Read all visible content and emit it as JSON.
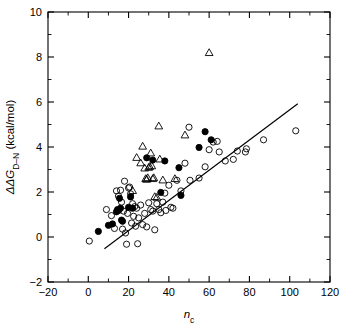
{
  "chart_data": {
    "type": "scatter",
    "title": "",
    "xlabel": "n_c",
    "xlabel_base": "n",
    "xlabel_sub": "c",
    "ylabel": "ΔΔG_D–N (kcal/mol)",
    "ylabel_base": "ΔΔG",
    "ylabel_sub": "D–N",
    "ylabel_units": " (kcal/mol)",
    "xlim": [
      -20,
      120
    ],
    "ylim": [
      -2,
      10
    ],
    "xticks": [
      -20,
      0,
      20,
      40,
      60,
      80,
      100,
      120
    ],
    "xtick_labels": [
      "−20",
      "0",
      "20",
      "40",
      "60",
      "80",
      "100",
      "120"
    ],
    "yticks": [
      -2,
      0,
      2,
      4,
      6,
      8,
      10
    ],
    "ytick_labels": [
      "−2",
      "0",
      "2",
      "4",
      "6",
      "8",
      "10"
    ],
    "x_minor_step": 10,
    "y_minor_step": 1,
    "grid": false,
    "legend": false,
    "legend_position": "none",
    "fit_line": {
      "name": "linear regression",
      "x_start": 8,
      "y_start": -0.52,
      "x_end": 104,
      "y_end": 5.92
    },
    "series": [
      {
        "name": "open circles",
        "marker": "open-circle",
        "points": [
          [
            0.5,
            -0.18
          ],
          [
            9.0,
            1.22
          ],
          [
            11.5,
            0.95
          ],
          [
            13.0,
            0.38
          ],
          [
            14.0,
            2.05
          ],
          [
            15.0,
            1.82
          ],
          [
            16.0,
            2.08
          ],
          [
            16.5,
            1.55
          ],
          [
            17.0,
            0.35
          ],
          [
            17.5,
            1.15
          ],
          [
            18.0,
            2.48
          ],
          [
            18.5,
            0.18
          ],
          [
            19.0,
            -0.32
          ],
          [
            19.5,
            1.05
          ],
          [
            20.0,
            2.18
          ],
          [
            20.5,
            2.22
          ],
          [
            21.0,
            1.92
          ],
          [
            21.5,
            0.62
          ],
          [
            22.0,
            1.48
          ],
          [
            22.5,
            0.92
          ],
          [
            23.0,
            1.35
          ],
          [
            23.5,
            0.48
          ],
          [
            24.0,
            1.28
          ],
          [
            24.5,
            -0.3
          ],
          [
            25.0,
            0.85
          ],
          [
            26.0,
            1.42
          ],
          [
            27.0,
            0.55
          ],
          [
            28.0,
            1.05
          ],
          [
            29.0,
            0.45
          ],
          [
            30.0,
            1.52
          ],
          [
            31.0,
            1.22
          ],
          [
            32.0,
            1.15
          ],
          [
            33.0,
            0.32
          ],
          [
            34.0,
            1.48
          ],
          [
            35.0,
            1.22
          ],
          [
            36.0,
            1.08
          ],
          [
            37.0,
            1.55
          ],
          [
            38.0,
            1.95
          ],
          [
            38.5,
            1.18
          ],
          [
            40.0,
            2.3
          ],
          [
            41.0,
            1.32
          ],
          [
            42.0,
            1.28
          ],
          [
            44.0,
            2.52
          ],
          [
            46.0,
            2.05
          ],
          [
            48.0,
            3.28
          ],
          [
            50.0,
            4.88
          ],
          [
            50.5,
            2.52
          ],
          [
            55.0,
            2.62
          ],
          [
            58.0,
            3.12
          ],
          [
            60.0,
            3.88
          ],
          [
            62.0,
            4.22
          ],
          [
            64.0,
            4.25
          ],
          [
            65.0,
            3.78
          ],
          [
            68.0,
            3.38
          ],
          [
            72.0,
            3.45
          ],
          [
            74.0,
            3.82
          ],
          [
            78.0,
            3.78
          ],
          [
            78.5,
            3.92
          ],
          [
            87.0,
            4.32
          ],
          [
            103.0,
            4.72
          ]
        ]
      },
      {
        "name": "filled circles",
        "marker": "filled-circle",
        "points": [
          [
            5.0,
            0.25
          ],
          [
            10.0,
            0.52
          ],
          [
            12.0,
            0.58
          ],
          [
            14.0,
            1.12
          ],
          [
            14.5,
            1.22
          ],
          [
            15.0,
            1.18
          ],
          [
            15.5,
            1.72
          ],
          [
            16.0,
            1.28
          ],
          [
            16.5,
            0.75
          ],
          [
            17.0,
            0.7
          ],
          [
            20.0,
            1.32
          ],
          [
            21.0,
            1.78
          ],
          [
            22.0,
            1.28
          ],
          [
            29.0,
            3.52
          ],
          [
            32.0,
            3.42
          ],
          [
            36.0,
            1.98
          ],
          [
            38.0,
            3.38
          ],
          [
            45.0,
            3.08
          ],
          [
            46.0,
            1.85
          ],
          [
            55.0,
            3.98
          ],
          [
            58.0,
            4.68
          ],
          [
            61.0,
            4.32
          ]
        ]
      },
      {
        "name": "open triangles",
        "marker": "open-triangle",
        "points": [
          [
            22.0,
            2.05
          ],
          [
            24.0,
            3.52
          ],
          [
            26.0,
            3.28
          ],
          [
            27.0,
            4.02
          ],
          [
            28.0,
            3.05
          ],
          [
            28.5,
            2.58
          ],
          [
            29.0,
            2.55
          ],
          [
            29.5,
            2.62
          ],
          [
            30.0,
            3.08
          ],
          [
            30.5,
            3.12
          ],
          [
            31.0,
            3.72
          ],
          [
            31.5,
            3.15
          ],
          [
            32.0,
            2.58
          ],
          [
            32.5,
            2.62
          ],
          [
            33.0,
            1.78
          ],
          [
            34.0,
            1.75
          ],
          [
            35.0,
            4.92
          ],
          [
            35.5,
            3.45
          ],
          [
            37.0,
            2.52
          ],
          [
            43.0,
            2.58
          ],
          [
            48.0,
            4.52
          ],
          [
            60.0,
            8.18
          ]
        ]
      }
    ]
  }
}
